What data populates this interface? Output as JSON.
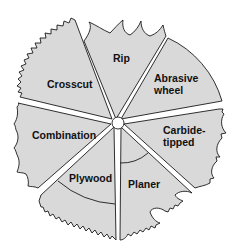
{
  "diagram": {
    "colors": {
      "blade_fill": "#d9d9d9",
      "outline": "#1a1a1a",
      "background": "#ffffff"
    },
    "sectors": [
      {
        "id": "rip",
        "label_lines": [
          "Rip"
        ]
      },
      {
        "id": "abrasive-wheel",
        "label_lines": [
          "Abrasive",
          "wheel"
        ]
      },
      {
        "id": "carbide-tipped",
        "label_lines": [
          "Carbide-",
          "tipped"
        ]
      },
      {
        "id": "planer",
        "label_lines": [
          "Planer"
        ]
      },
      {
        "id": "plywood",
        "label_lines": [
          "Plywood"
        ]
      },
      {
        "id": "combination",
        "label_lines": [
          "Combination"
        ]
      },
      {
        "id": "crosscut",
        "label_lines": [
          "Crosscut"
        ]
      }
    ]
  }
}
